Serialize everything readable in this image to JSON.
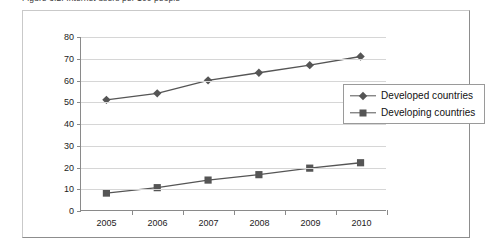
{
  "figure": {
    "caption": "Figure 3.2: Internet users per 100 people"
  },
  "chart_data": {
    "type": "line",
    "title": "Figure 3.2: Internet users per 100 people",
    "xlabel": "",
    "ylabel": "",
    "categories": [
      "2005",
      "2006",
      "2007",
      "2008",
      "2009",
      "2010"
    ],
    "series": [
      {
        "name": "Developed countries",
        "marker": "diamond",
        "color": "#555555",
        "values": [
          51,
          54,
          60,
          63.5,
          67,
          71
        ]
      },
      {
        "name": "Developing countries",
        "marker": "square",
        "color": "#555555",
        "values": [
          8,
          10.5,
          14,
          16.5,
          19.5,
          22
        ]
      }
    ],
    "ylim": [
      0,
      80
    ],
    "yticks": [
      0,
      10,
      20,
      30,
      40,
      50,
      60,
      70,
      80
    ],
    "grid": true,
    "legend_position": "right-inside"
  },
  "colors": {
    "series_line": "#555555",
    "gridline": "#d6d6d6",
    "axis": "#8a8a8a",
    "frame": "#c9c9c9",
    "frame_shadow": "#8d8d8d",
    "text": "#1c1c1c"
  }
}
